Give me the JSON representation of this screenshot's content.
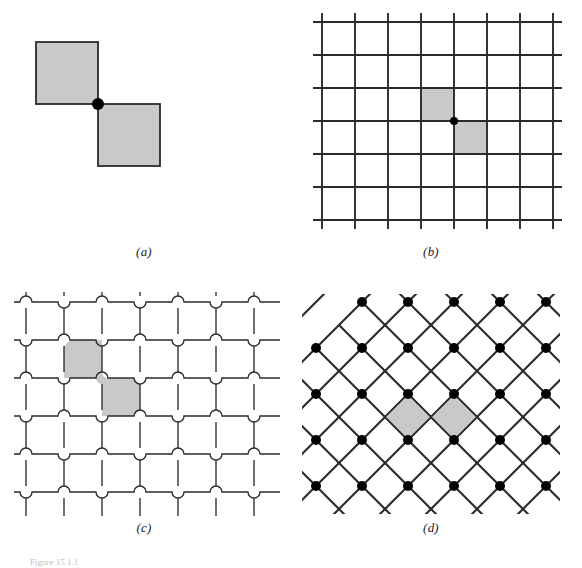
{
  "figure": {
    "caption": "Figure 15.1.1",
    "background": "#ffffff",
    "line_color": "#2b2b2b",
    "fill_color": "#c9c9c9",
    "dot_color": "#000000",
    "panels": [
      {
        "id": "a",
        "label": "(a)",
        "name": "two-squares-corner-touching",
        "description": "Two shaded squares meeting at a single corner with a marked vertex dot",
        "square_size": 62,
        "squares": [
          {
            "x": 18,
            "y": 34,
            "w": 62,
            "h": 62
          },
          {
            "x": 80,
            "y": 96,
            "w": 62,
            "h": 62
          }
        ],
        "dots": [
          {
            "x": 80,
            "y": 96,
            "r": 6
          }
        ],
        "dot_count": 1
      },
      {
        "id": "b",
        "label": "(b)",
        "name": "square-lattice-diagonal-cells",
        "description": "Square grid with two diagonally adjacent shaded cells sharing one corner",
        "cell_size": 33,
        "columns": 7,
        "rows": 6,
        "overhang": 9,
        "shaded_cells": [
          {
            "col": 3,
            "row": 2
          },
          {
            "col": 4,
            "row": 3
          }
        ],
        "dots": [
          {
            "col": 4,
            "row": 3,
            "r": 4
          }
        ],
        "dot_count": 1
      },
      {
        "id": "c",
        "label": "(c)",
        "name": "jogged-lattice-offset-crossings",
        "description": "Grid whose lines make small arc jogs at every crossing so no two lines meet; two shaded cells touch along a narrow neck",
        "cell_size": 38,
        "columns": 7,
        "rows": 6,
        "jog_radius": 6,
        "shaded_cells": [
          {
            "col": 1,
            "row": 1
          },
          {
            "col": 2,
            "row": 2
          }
        ],
        "dot_count": 0
      },
      {
        "id": "d",
        "label": "(d)",
        "name": "diagonal-lattice-shaded-diamonds",
        "description": "Diagonal (45 degree) lattice with dots on alternating intersections and two shaded diamond cells sharing an edge",
        "cell_size": 46,
        "columns": 6,
        "rows": 6,
        "dot_radius": 5,
        "dot_parity": "even",
        "shaded_cells": [
          {
            "col": 2,
            "row": 1
          },
          {
            "col": 3,
            "row": 2
          }
        ],
        "dot_count": 13
      }
    ]
  }
}
